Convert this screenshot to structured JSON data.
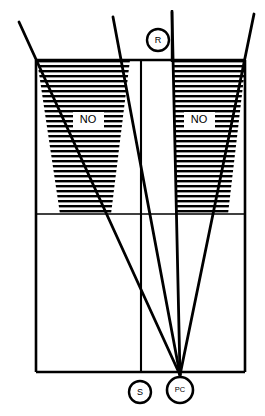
{
  "diagram": {
    "background_color": "#ffffff",
    "stroke_color": "#000000",
    "hatch_color": "#000000",
    "zones": [
      {
        "id": "left-no-zone",
        "label": "NO",
        "label_x": 88,
        "label_y": 120,
        "hatch_spacing_px": 5
      },
      {
        "id": "right-no-zone",
        "label": "NO",
        "label_x": 199,
        "label_y": 120,
        "hatch_spacing_px": 5
      }
    ],
    "nodes": [
      {
        "id": "node-r",
        "label": "R",
        "cx": 158,
        "cy": 40,
        "r": 11
      },
      {
        "id": "node-s",
        "label": "S",
        "cx": 140,
        "cy": 392,
        "r": 11
      },
      {
        "id": "node-pc",
        "label": "PC",
        "cx": 180,
        "cy": 390,
        "r": 13
      }
    ],
    "frame": {
      "left": 36,
      "right": 245,
      "top": 60,
      "bottom": 372,
      "divider_y": 214
    },
    "vertical_lines": [
      {
        "id": "line-s-vertical",
        "x": 141,
        "y1": 60,
        "y2": 372
      },
      {
        "id": "line-r-vertical",
        "x": 172,
        "y1": 10,
        "y2": 60
      }
    ],
    "sight_lines": [
      {
        "id": "sight-line-far-left",
        "x1": 19,
        "y1": 22,
        "x2": 180,
        "y2": 375
      },
      {
        "id": "sight-line-inner-left",
        "x1": 113,
        "y1": 17,
        "x2": 180,
        "y2": 375
      },
      {
        "id": "sight-line-inner-right",
        "x1": 172,
        "y1": 10,
        "x2": 180,
        "y2": 375
      },
      {
        "id": "sight-line-far-right",
        "x1": 254,
        "y1": 14,
        "x2": 180,
        "y2": 375
      }
    ]
  }
}
